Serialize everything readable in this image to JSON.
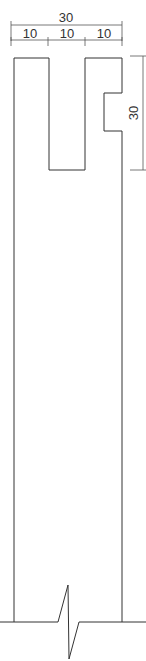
{
  "drawing": {
    "title": "Slotted beam end profile",
    "dimensions": {
      "overall_width": "30",
      "segment_1": "10",
      "segment_2": "10",
      "segment_3": "10",
      "notch_height": "30"
    },
    "colors": {
      "line": "#333333",
      "background": "#ffffff"
    }
  }
}
